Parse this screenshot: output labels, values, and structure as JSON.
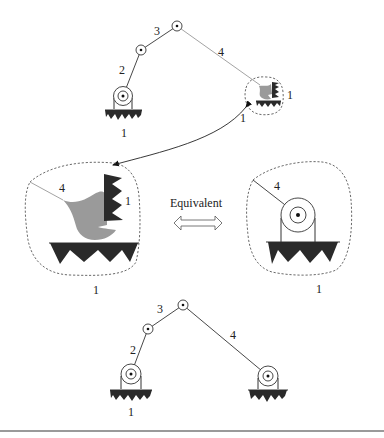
{
  "figure": {
    "top_mechanism": {
      "link_labels": {
        "link2": "2",
        "link3": "3",
        "link4": "4"
      },
      "ground_label_left": "1",
      "ground_label_right_side": "1",
      "ground_label_right_below": "1"
    },
    "zoom_left": {
      "link_label": "4",
      "frame_label_side": "1",
      "frame_label_below": "1"
    },
    "equivalence": {
      "text": "Equivalent"
    },
    "zoom_right": {
      "link_label": "4",
      "frame_label_below": "1"
    },
    "bottom_mechanism": {
      "link_labels": {
        "link2": "2",
        "link3": "3",
        "link4": "4"
      },
      "ground_label": "1"
    }
  },
  "colors": {
    "link": "#333333",
    "ground": "#2a2a2a",
    "body_gray": "#9a9a9a",
    "rule": "#9a9a9a"
  }
}
